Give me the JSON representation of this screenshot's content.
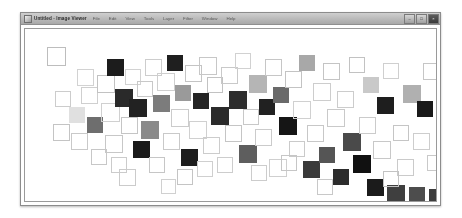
{
  "window": {
    "title": "Untitled - Image Viewer",
    "icon": "application-icon",
    "menus": [
      {
        "label": "File"
      },
      {
        "label": "Edit"
      },
      {
        "label": "View"
      },
      {
        "label": "Tools"
      },
      {
        "label": "Layer"
      },
      {
        "label": "Filter"
      },
      {
        "label": "Window"
      },
      {
        "label": "Help"
      }
    ],
    "controls": [
      {
        "name": "minimize-button",
        "glyph": "–"
      },
      {
        "name": "maximize-button",
        "glyph": "□"
      },
      {
        "name": "close-button",
        "glyph": "×"
      }
    ]
  },
  "canvas": {
    "background": "#ffffff",
    "outline_color": "#c9c9c9",
    "squares": [
      {
        "x": 22,
        "y": 18,
        "size": 19,
        "fill": "none",
        "stroke": "#bdbdbd"
      },
      {
        "x": 28,
        "y": 95,
        "size": 17,
        "fill": "none",
        "stroke": "#c4c4c4"
      },
      {
        "x": 30,
        "y": 62,
        "size": 16,
        "fill": "none",
        "stroke": "#cccccc"
      },
      {
        "x": 44,
        "y": 78,
        "size": 16,
        "fill": "#e0e0e0",
        "stroke": "none"
      },
      {
        "x": 46,
        "y": 104,
        "size": 17,
        "fill": "none",
        "stroke": "#c9c9c9"
      },
      {
        "x": 56,
        "y": 58,
        "size": 17,
        "fill": "none",
        "stroke": "#cfcfcf"
      },
      {
        "x": 62,
        "y": 88,
        "size": 16,
        "fill": "#6e6e6e",
        "stroke": "none"
      },
      {
        "x": 72,
        "y": 46,
        "size": 18,
        "fill": "none",
        "stroke": "#c2c2c2"
      },
      {
        "x": 76,
        "y": 74,
        "size": 19,
        "fill": "none",
        "stroke": "#d0d0d0"
      },
      {
        "x": 80,
        "y": 106,
        "size": 18,
        "fill": "none",
        "stroke": "#c7c7c7"
      },
      {
        "x": 82,
        "y": 30,
        "size": 17,
        "fill": "#1c1c1c",
        "stroke": "none"
      },
      {
        "x": 86,
        "y": 128,
        "size": 16,
        "fill": "none",
        "stroke": "#cbcbcb"
      },
      {
        "x": 90,
        "y": 60,
        "size": 18,
        "fill": "#2a2a2a",
        "stroke": "none"
      },
      {
        "x": 96,
        "y": 88,
        "size": 17,
        "fill": "none",
        "stroke": "#c5c5c5"
      },
      {
        "x": 100,
        "y": 40,
        "size": 16,
        "fill": "none",
        "stroke": "#d2d2d2"
      },
      {
        "x": 104,
        "y": 70,
        "size": 18,
        "fill": "#222222",
        "stroke": "none"
      },
      {
        "x": 108,
        "y": 112,
        "size": 17,
        "fill": "#1a1a1a",
        "stroke": "none"
      },
      {
        "x": 112,
        "y": 52,
        "size": 16,
        "fill": "none",
        "stroke": "#c8c8c8"
      },
      {
        "x": 116,
        "y": 92,
        "size": 18,
        "fill": "#8a8a8a",
        "stroke": "none"
      },
      {
        "x": 120,
        "y": 30,
        "size": 17,
        "fill": "none",
        "stroke": "#cdcdcd"
      },
      {
        "x": 124,
        "y": 128,
        "size": 16,
        "fill": "none",
        "stroke": "#c6c6c6"
      },
      {
        "x": 128,
        "y": 66,
        "size": 17,
        "fill": "#7c7c7c",
        "stroke": "none"
      },
      {
        "x": 132,
        "y": 44,
        "size": 18,
        "fill": "none",
        "stroke": "#cfcfcf"
      },
      {
        "x": 138,
        "y": 104,
        "size": 17,
        "fill": "none",
        "stroke": "#c9c9c9"
      },
      {
        "x": 142,
        "y": 26,
        "size": 16,
        "fill": "#1f1f1f",
        "stroke": "none"
      },
      {
        "x": 146,
        "y": 80,
        "size": 18,
        "fill": "none",
        "stroke": "#cbcbcb"
      },
      {
        "x": 150,
        "y": 56,
        "size": 16,
        "fill": "#9a9a9a",
        "stroke": "none"
      },
      {
        "x": 156,
        "y": 120,
        "size": 17,
        "fill": "#1d1d1d",
        "stroke": "none"
      },
      {
        "x": 160,
        "y": 36,
        "size": 17,
        "fill": "none",
        "stroke": "#c4c4c4"
      },
      {
        "x": 164,
        "y": 92,
        "size": 18,
        "fill": "none",
        "stroke": "#d0d0d0"
      },
      {
        "x": 168,
        "y": 64,
        "size": 16,
        "fill": "#242424",
        "stroke": "none"
      },
      {
        "x": 174,
        "y": 28,
        "size": 18,
        "fill": "none",
        "stroke": "#c7c7c7"
      },
      {
        "x": 178,
        "y": 108,
        "size": 17,
        "fill": "none",
        "stroke": "#cccccc"
      },
      {
        "x": 182,
        "y": 48,
        "size": 16,
        "fill": "none",
        "stroke": "#c2c2c2"
      },
      {
        "x": 186,
        "y": 78,
        "size": 18,
        "fill": "#2b2b2b",
        "stroke": "none"
      },
      {
        "x": 192,
        "y": 128,
        "size": 16,
        "fill": "none",
        "stroke": "#cdcdcd"
      },
      {
        "x": 196,
        "y": 38,
        "size": 17,
        "fill": "none",
        "stroke": "#c9c9c9"
      },
      {
        "x": 200,
        "y": 96,
        "size": 17,
        "fill": "none",
        "stroke": "#c5c5c5"
      },
      {
        "x": 204,
        "y": 62,
        "size": 18,
        "fill": "#2e2e2e",
        "stroke": "none"
      },
      {
        "x": 210,
        "y": 24,
        "size": 16,
        "fill": "none",
        "stroke": "#d1d1d1"
      },
      {
        "x": 214,
        "y": 116,
        "size": 18,
        "fill": "#5e5e5e",
        "stroke": "none"
      },
      {
        "x": 218,
        "y": 80,
        "size": 16,
        "fill": "none",
        "stroke": "#c8c8c8"
      },
      {
        "x": 224,
        "y": 46,
        "size": 18,
        "fill": "#b5b5b5",
        "stroke": "none"
      },
      {
        "x": 230,
        "y": 100,
        "size": 17,
        "fill": "none",
        "stroke": "#cbcbcb"
      },
      {
        "x": 234,
        "y": 70,
        "size": 16,
        "fill": "#212121",
        "stroke": "none"
      },
      {
        "x": 240,
        "y": 30,
        "size": 17,
        "fill": "none",
        "stroke": "#c6c6c6"
      },
      {
        "x": 244,
        "y": 130,
        "size": 18,
        "fill": "none",
        "stroke": "#cfcfcf"
      },
      {
        "x": 248,
        "y": 58,
        "size": 16,
        "fill": "#6a6a6a",
        "stroke": "none"
      },
      {
        "x": 254,
        "y": 88,
        "size": 18,
        "fill": "#151515",
        "stroke": "none"
      },
      {
        "x": 260,
        "y": 42,
        "size": 17,
        "fill": "none",
        "stroke": "#c3c3c3"
      },
      {
        "x": 264,
        "y": 112,
        "size": 16,
        "fill": "none",
        "stroke": "#cacaca"
      },
      {
        "x": 268,
        "y": 72,
        "size": 18,
        "fill": "none",
        "stroke": "#d0d0d0"
      },
      {
        "x": 274,
        "y": 26,
        "size": 16,
        "fill": "#a8a8a8",
        "stroke": "none"
      },
      {
        "x": 278,
        "y": 132,
        "size": 17,
        "fill": "#3a3a3a",
        "stroke": "none"
      },
      {
        "x": 282,
        "y": 96,
        "size": 17,
        "fill": "none",
        "stroke": "#c7c7c7"
      },
      {
        "x": 288,
        "y": 54,
        "size": 18,
        "fill": "none",
        "stroke": "#cdcdcd"
      },
      {
        "x": 294,
        "y": 118,
        "size": 16,
        "fill": "#555555",
        "stroke": "none"
      },
      {
        "x": 298,
        "y": 34,
        "size": 17,
        "fill": "none",
        "stroke": "#c4c4c4"
      },
      {
        "x": 302,
        "y": 80,
        "size": 18,
        "fill": "none",
        "stroke": "#c9c9c9"
      },
      {
        "x": 308,
        "y": 140,
        "size": 16,
        "fill": "#2c2c2c",
        "stroke": "none"
      },
      {
        "x": 312,
        "y": 62,
        "size": 17,
        "fill": "none",
        "stroke": "#cccccc"
      },
      {
        "x": 318,
        "y": 104,
        "size": 18,
        "fill": "#4a4a4a",
        "stroke": "none"
      },
      {
        "x": 324,
        "y": 28,
        "size": 16,
        "fill": "none",
        "stroke": "#c2c2c2"
      },
      {
        "x": 328,
        "y": 126,
        "size": 18,
        "fill": "#111111",
        "stroke": "none"
      },
      {
        "x": 334,
        "y": 88,
        "size": 17,
        "fill": "none",
        "stroke": "#cbcbcb"
      },
      {
        "x": 338,
        "y": 48,
        "size": 16,
        "fill": "#c9c9c9",
        "stroke": "none"
      },
      {
        "x": 342,
        "y": 150,
        "size": 17,
        "fill": "#1b1b1b",
        "stroke": "none"
      },
      {
        "x": 348,
        "y": 112,
        "size": 18,
        "fill": "none",
        "stroke": "#c8c8c8"
      },
      {
        "x": 352,
        "y": 68,
        "size": 17,
        "fill": "#1e1e1e",
        "stroke": "none"
      },
      {
        "x": 358,
        "y": 34,
        "size": 16,
        "fill": "none",
        "stroke": "#cfcfcf"
      },
      {
        "x": 362,
        "y": 156,
        "size": 18,
        "fill": "#3f3f3f",
        "stroke": "none"
      },
      {
        "x": 368,
        "y": 96,
        "size": 16,
        "fill": "none",
        "stroke": "#c5c5c5"
      },
      {
        "x": 372,
        "y": 130,
        "size": 17,
        "fill": "none",
        "stroke": "#cacaca"
      },
      {
        "x": 378,
        "y": 56,
        "size": 18,
        "fill": "#b0b0b0",
        "stroke": "none"
      },
      {
        "x": 384,
        "y": 158,
        "size": 16,
        "fill": "#4d4d4d",
        "stroke": "none"
      },
      {
        "x": 388,
        "y": 104,
        "size": 17,
        "fill": "none",
        "stroke": "#cdcdcd"
      },
      {
        "x": 392,
        "y": 72,
        "size": 16,
        "fill": "#1a1a1a",
        "stroke": "none"
      },
      {
        "x": 398,
        "y": 34,
        "size": 17,
        "fill": "none",
        "stroke": "#c6c6c6"
      },
      {
        "x": 402,
        "y": 126,
        "size": 16,
        "fill": "none",
        "stroke": "#c9c9c9"
      },
      {
        "x": 404,
        "y": 160,
        "size": 17,
        "fill": "#3c3c3c",
        "stroke": "none"
      },
      {
        "x": 52,
        "y": 40,
        "size": 17,
        "fill": "none",
        "stroke": "#d2d2d2"
      },
      {
        "x": 66,
        "y": 120,
        "size": 16,
        "fill": "none",
        "stroke": "#c7c7c7"
      },
      {
        "x": 94,
        "y": 140,
        "size": 17,
        "fill": "none",
        "stroke": "#cbcbcb"
      },
      {
        "x": 152,
        "y": 140,
        "size": 16,
        "fill": "none",
        "stroke": "#c4c4c4"
      },
      {
        "x": 226,
        "y": 136,
        "size": 16,
        "fill": "none",
        "stroke": "#cccccc"
      },
      {
        "x": 292,
        "y": 150,
        "size": 16,
        "fill": "none",
        "stroke": "#c8c8c8"
      },
      {
        "x": 358,
        "y": 142,
        "size": 16,
        "fill": "none",
        "stroke": "#c3c3c3"
      },
      {
        "x": 172,
        "y": 132,
        "size": 16,
        "fill": "none",
        "stroke": "#cfcfcf"
      },
      {
        "x": 136,
        "y": 150,
        "size": 15,
        "fill": "none",
        "stroke": "#d0d0d0"
      },
      {
        "x": 256,
        "y": 126,
        "size": 16,
        "fill": "none",
        "stroke": "#c6c6c6"
      }
    ]
  }
}
